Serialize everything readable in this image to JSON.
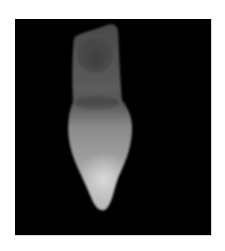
{
  "image": {
    "subject": "tooth-radiograph",
    "description": "Grayscale radiograph of a single tooth on a black background",
    "colors": {
      "page_background": "#ffffff",
      "frame_background": "#000000",
      "root_tone": "#5a5a5a",
      "crown_tone": "#9a9a9a",
      "tip_highlight": "#d0d0d0"
    }
  }
}
